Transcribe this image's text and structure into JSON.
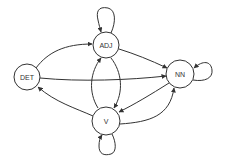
{
  "diagram": {
    "type": "state-transition-graph",
    "nodes": [
      {
        "id": "DET",
        "label": "DET",
        "cx": 27,
        "cy": 77,
        "r": 13
      },
      {
        "id": "ADJ",
        "label": "ADJ",
        "cx": 106,
        "cy": 45,
        "r": 13
      },
      {
        "id": "NN",
        "label": "NN",
        "cx": 180,
        "cy": 74,
        "r": 14
      },
      {
        "id": "V",
        "label": "V",
        "cx": 106,
        "cy": 121,
        "r": 14
      }
    ],
    "edges": [
      {
        "from": "DET",
        "to": "ADJ"
      },
      {
        "from": "DET",
        "to": "NN"
      },
      {
        "from": "V",
        "to": "DET"
      },
      {
        "from": "ADJ",
        "to": "NN"
      },
      {
        "from": "ADJ",
        "to": "V"
      },
      {
        "from": "V",
        "to": "ADJ"
      },
      {
        "from": "NN",
        "to": "V"
      },
      {
        "from": "V",
        "to": "NN"
      },
      {
        "from": "ADJ",
        "to": "ADJ"
      },
      {
        "from": "NN",
        "to": "NN"
      },
      {
        "from": "V",
        "to": "V"
      }
    ],
    "colors": {
      "stroke": "#333333",
      "fill": "#ffffff",
      "text": "#333333"
    }
  }
}
